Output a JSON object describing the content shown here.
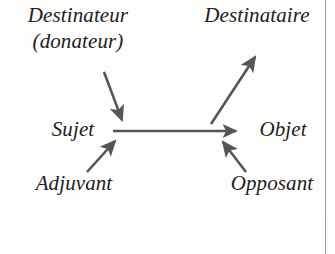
{
  "diagram": {
    "type": "actantial-model",
    "background_color": "#fdfdfc",
    "text_color": "#23201e",
    "arrow_color": "#585654",
    "border_color": "#9a9a98",
    "labels": {
      "destinateur": "Destinateur",
      "donateur": "(donateur)",
      "destinataire": "Destinataire",
      "sujet": "Sujet",
      "objet": "Objet",
      "adjuvant": "Adjuvant",
      "opposant": "Opposant"
    },
    "arrows": [
      {
        "name": "destinateur-to-sujet",
        "from": "Destinateur (donateur)",
        "to": "Sujet",
        "direction": "down-right",
        "x1": 104,
        "y1": 72,
        "x2": 123,
        "y2": 122
      },
      {
        "name": "sujet-to-objet",
        "from": "Sujet",
        "to": "Objet",
        "direction": "right",
        "x1": 113,
        "y1": 131,
        "x2": 240,
        "y2": 131
      },
      {
        "name": "objet-to-destinataire",
        "from": "Objet",
        "to": "Destinataire",
        "direction": "up-right",
        "x1": 211,
        "y1": 124,
        "x2": 257,
        "y2": 54
      },
      {
        "name": "adjuvant-to-sujet",
        "from": "Adjuvant",
        "to": "Sujet",
        "direction": "up-right",
        "x1": 87,
        "y1": 172,
        "x2": 117,
        "y2": 139
      },
      {
        "name": "opposant-to-objet",
        "from": "Opposant",
        "to": "Objet",
        "direction": "up-left",
        "x1": 246,
        "y1": 172,
        "x2": 221,
        "y2": 140
      }
    ]
  }
}
